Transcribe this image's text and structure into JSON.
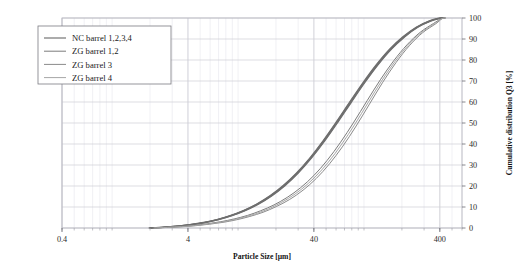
{
  "chart_data": {
    "type": "line",
    "title": "",
    "xlabel": "Particle Size [µm]",
    "ylabel": "Cumulative distribution Q3 [%]",
    "xscale": "log",
    "xlim": [
      0.4,
      600
    ],
    "ylim": [
      0,
      100
    ],
    "xticks": [
      0.4,
      4,
      40,
      400
    ],
    "xtick_labels": [
      "0.4",
      "4",
      "40",
      "400"
    ],
    "yticks": [
      0,
      10,
      20,
      30,
      40,
      50,
      60,
      70,
      80,
      90,
      100
    ],
    "ytick_labels": [
      "0",
      "10",
      "20",
      "30",
      "40",
      "50",
      "60",
      "70",
      "80",
      "90",
      "100"
    ],
    "y_axis_position": "right",
    "grid": true,
    "grid_minor_x": true,
    "legend_position": "top-left",
    "series": [
      {
        "name": "NC barrel 1,2,3,4",
        "color": "#6e6e6e",
        "width": 1.15,
        "x": [
          2.0,
          2.6,
          3.3,
          4.2,
          5.4,
          6.9,
          8.8,
          11.2,
          14.3,
          18.2,
          23.2,
          29.6,
          37.8,
          48.2,
          61.4,
          78.3,
          99.8,
          127.2,
          162.2,
          206.8,
          263.6,
          336.0,
          400.0,
          430.0
        ],
        "y": [
          0.0,
          0.4,
          0.9,
          1.6,
          2.6,
          4.0,
          5.9,
          8.3,
          11.4,
          15.3,
          20.2,
          26.2,
          33.4,
          41.6,
          50.6,
          60.0,
          69.2,
          77.7,
          85.1,
          91.0,
          95.6,
          98.6,
          99.9,
          100.0
        ]
      },
      {
        "name": "ZG barrel 1,2",
        "color": "#7c7c7c",
        "width": 1.0,
        "x": [
          2.1,
          2.7,
          3.5,
          4.4,
          5.7,
          7.3,
          9.3,
          11.9,
          15.1,
          19.3,
          24.6,
          31.4,
          40.0,
          51.0,
          65.1,
          83.0,
          105.8,
          134.9,
          172.0,
          219.3,
          279.6,
          356.5,
          410.0,
          440.0
        ],
        "y": [
          0.0,
          0.3,
          0.7,
          1.2,
          2.0,
          3.0,
          4.3,
          6.0,
          8.2,
          11.0,
          14.6,
          19.2,
          25.0,
          32.2,
          40.8,
          50.4,
          60.6,
          70.6,
          79.6,
          87.2,
          93.2,
          97.4,
          99.6,
          100.0
        ]
      },
      {
        "name": "ZG barrel 3",
        "color": "#8a8a8a",
        "width": 1.0,
        "x": [
          2.2,
          2.8,
          3.6,
          4.6,
          5.9,
          7.6,
          9.7,
          12.4,
          15.8,
          20.1,
          25.7,
          32.8,
          41.8,
          53.3,
          68.0,
          86.7,
          110.5,
          140.9,
          179.7,
          229.1,
          292.1,
          372.4,
          415.0,
          445.0
        ],
        "y": [
          0.0,
          0.3,
          0.6,
          1.1,
          1.8,
          2.7,
          3.9,
          5.5,
          7.5,
          10.2,
          13.6,
          18.0,
          23.6,
          30.6,
          39.0,
          48.6,
          59.0,
          69.4,
          78.8,
          86.8,
          93.0,
          97.3,
          99.6,
          100.0
        ]
      },
      {
        "name": "ZG barrel 4",
        "color": "#a6a6a6",
        "width": 1.0,
        "x": [
          2.15,
          2.75,
          3.55,
          4.5,
          5.8,
          7.45,
          9.5,
          12.1,
          15.5,
          19.7,
          25.1,
          32.1,
          40.9,
          52.2,
          66.5,
          84.8,
          108.1,
          137.9,
          175.8,
          224.2,
          285.8,
          364.4,
          412.0,
          442.0
        ],
        "y": [
          0.0,
          0.3,
          0.65,
          1.15,
          1.9,
          2.85,
          4.1,
          5.75,
          7.85,
          10.6,
          14.1,
          18.6,
          24.3,
          31.4,
          39.9,
          49.5,
          59.8,
          70.0,
          79.2,
          87.0,
          93.1,
          97.35,
          99.6,
          100.0
        ]
      }
    ]
  },
  "legend": {
    "entries": [
      {
        "label": "NC barrel 1,2,3,4"
      },
      {
        "label": "ZG barrel 1,2"
      },
      {
        "label": "ZG barrel 3"
      },
      {
        "label": "ZG barrel 4"
      }
    ]
  },
  "axes": {
    "x_title": "Particle Size [µm]",
    "y_title": "Cumulative distribution Q3 [%]"
  },
  "colors": {
    "grid_major": "#cfcfd6",
    "grid_minor": "#e6e6ec",
    "frame": "#b9b9c2",
    "text": "#1a1a1a"
  }
}
